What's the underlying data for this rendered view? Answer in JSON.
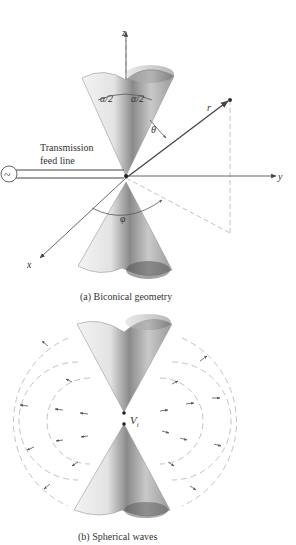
{
  "header": {
    "text": ""
  },
  "figure_a": {
    "caption": "(a) Biconical geometry",
    "labels": {
      "z_axis": "z",
      "y_axis": "y",
      "x_axis": "x",
      "radius": "r",
      "theta": "θ",
      "phi": "φ",
      "half_angle_left": "α/2",
      "half_angle_right": "α/2",
      "feed_line_1": "Transmission",
      "feed_line_2": "feed line",
      "source_symbol": "~"
    }
  },
  "figure_b": {
    "caption": "(b) Spherical waves",
    "labels": {
      "voltage": "V",
      "voltage_sub": "i"
    }
  },
  "colors": {
    "line": "#444444",
    "dashed": "#bbbbbb",
    "cone_dark": "#6d6d6d",
    "cone_light": "#f2f2f2"
  }
}
